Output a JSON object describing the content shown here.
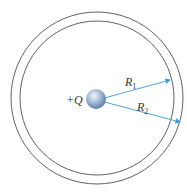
{
  "diagram": {
    "charge_label": "+Q",
    "radius1_label": "R",
    "radius1_sub": "1",
    "radius2_label": "R",
    "radius2_sub": "2",
    "colors": {
      "shell": "#4a4f5c",
      "arrow": "#3a9ad9",
      "sphere": "#7f9fc4"
    }
  }
}
